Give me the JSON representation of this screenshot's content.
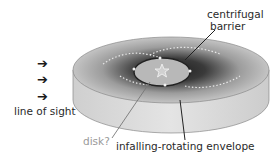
{
  "diagram": {
    "labels": {
      "centrifugal_line1": "centrifugal",
      "centrifugal_line2": "barrier",
      "line_of_sight": "line of sight",
      "disk": "disk?",
      "envelope": "infalling-rotating envelope"
    },
    "arrow_glyph": "➔",
    "colors": {
      "envelope_side": "#d8d8d8",
      "envelope_top_outer": "#bdbdbd",
      "envelope_inner_dark": "#2e2e2e",
      "disk": "#b8b8b8",
      "text": "#2a2a2a",
      "disk_label": "#9a9a9a"
    }
  }
}
